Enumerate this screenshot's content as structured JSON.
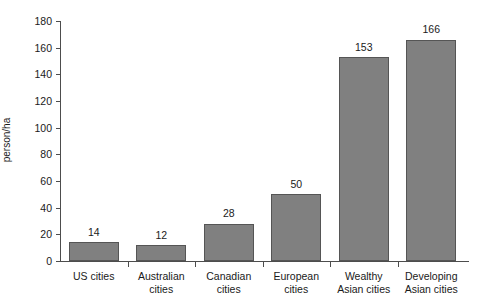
{
  "chart_data": {
    "type": "bar",
    "title": "",
    "subtitle": "",
    "xlabel": "",
    "ylabel": "person/ha",
    "ylim": [
      0,
      180
    ],
    "ytick_values": [
      0,
      20,
      40,
      60,
      80,
      100,
      120,
      140,
      160,
      180
    ],
    "ytick_labels": [
      "0",
      "20",
      "40",
      "60",
      "80",
      "100",
      "120",
      "140",
      "160",
      "180"
    ],
    "grid": false,
    "legend": false,
    "legend_position": "none",
    "bar_color": "#808080",
    "bar_border_color": "#555555",
    "axis_color": "#4d4d4d",
    "text_color": "#1a1a1a",
    "background": "#ffffff",
    "show_value_labels": true,
    "categories": [
      "US cities",
      "Australian cities",
      "Canadian cities",
      "European cities",
      "Wealthy Asian cities",
      "Developing Asian cities"
    ],
    "category_label_lines": [
      [
        "US cities"
      ],
      [
        "Australian",
        "cities"
      ],
      [
        "Canadian",
        "cities"
      ],
      [
        "European",
        "cities"
      ],
      [
        "Wealthy",
        "Asian cities"
      ],
      [
        "Developing",
        "Asian cities"
      ]
    ],
    "values": [
      14,
      12,
      28,
      50,
      153,
      166
    ],
    "value_labels": [
      "14",
      "12",
      "28",
      "50",
      "153",
      "166"
    ]
  }
}
